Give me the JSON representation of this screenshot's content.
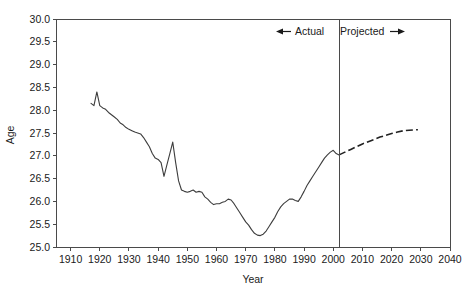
{
  "chart_data": {
    "type": "line",
    "title": "",
    "xlabel": "Year",
    "ylabel": "Age",
    "xlim": [
      1905,
      2040
    ],
    "ylim": [
      25.0,
      30.0
    ],
    "grid": false,
    "legend_position": "none",
    "xticks": [
      1910,
      1920,
      1930,
      1940,
      1950,
      1960,
      1970,
      1980,
      1990,
      2000,
      2010,
      2020,
      2030,
      2040
    ],
    "xticklabels": [
      "1910",
      "1920",
      "1930",
      "1940",
      "1950",
      "1960",
      "1970",
      "1980",
      "1990",
      "2000",
      "2010",
      "2020",
      "2030",
      "2040"
    ],
    "yticks": [
      25.0,
      25.5,
      26.0,
      26.5,
      27.0,
      27.5,
      28.0,
      28.5,
      29.0,
      29.5,
      30.0
    ],
    "yticklabels": [
      "25.0",
      "25.5",
      "26.0",
      "26.5",
      "27.0",
      "27.5",
      "28.0",
      "28.5",
      "29.0",
      "29.5",
      "30.0"
    ],
    "annotations": [
      {
        "label": "Actual",
        "arrow": "left",
        "at_year": 1985
      },
      {
        "label": "Projected",
        "arrow": "right",
        "at_year": 2020
      }
    ],
    "divider_year": 2002,
    "series": [
      {
        "name": "Actual",
        "style": "solid",
        "x": [
          1917,
          1918,
          1919,
          1920,
          1921,
          1922,
          1923,
          1924,
          1925,
          1926,
          1927,
          1928,
          1929,
          1930,
          1931,
          1932,
          1933,
          1934,
          1935,
          1936,
          1937,
          1938,
          1939,
          1940,
          1941,
          1942,
          1943,
          1944,
          1945,
          1946,
          1947,
          1948,
          1949,
          1950,
          1951,
          1952,
          1953,
          1954,
          1955,
          1956,
          1957,
          1958,
          1959,
          1960,
          1961,
          1962,
          1963,
          1964,
          1965,
          1966,
          1967,
          1968,
          1969,
          1970,
          1971,
          1972,
          1973,
          1974,
          1975,
          1976,
          1977,
          1978,
          1979,
          1980,
          1981,
          1982,
          1983,
          1984,
          1985,
          1986,
          1987,
          1988,
          1989,
          1990,
          1991,
          1992,
          1993,
          1994,
          1995,
          1996,
          1997,
          1998,
          1999,
          2000,
          2001,
          2002
        ],
        "values": [
          28.15,
          28.1,
          28.4,
          28.1,
          28.05,
          28.02,
          27.95,
          27.9,
          27.85,
          27.8,
          27.72,
          27.68,
          27.62,
          27.58,
          27.55,
          27.52,
          27.5,
          27.48,
          27.4,
          27.3,
          27.2,
          27.05,
          26.95,
          26.92,
          26.85,
          26.55,
          26.8,
          27.05,
          27.3,
          26.85,
          26.45,
          26.25,
          26.22,
          26.2,
          26.22,
          26.25,
          26.2,
          26.22,
          26.2,
          26.1,
          26.05,
          25.98,
          25.93,
          25.95,
          25.95,
          25.98,
          26.0,
          26.05,
          26.03,
          25.95,
          25.85,
          25.75,
          25.65,
          25.55,
          25.48,
          25.38,
          25.3,
          25.26,
          25.25,
          25.28,
          25.35,
          25.45,
          25.55,
          25.65,
          25.78,
          25.88,
          25.95,
          26.0,
          26.05,
          26.05,
          26.02,
          26.0,
          26.1,
          26.22,
          26.35,
          26.45,
          26.55,
          26.65,
          26.75,
          26.85,
          26.95,
          27.02,
          27.08,
          27.12,
          27.05,
          27.02
        ]
      },
      {
        "name": "Projected",
        "style": "dashed",
        "x": [
          2002,
          2004,
          2006,
          2008,
          2010,
          2012,
          2014,
          2016,
          2018,
          2020,
          2022,
          2024,
          2026,
          2028,
          2029
        ],
        "values": [
          27.02,
          27.08,
          27.14,
          27.2,
          27.26,
          27.31,
          27.36,
          27.41,
          27.45,
          27.49,
          27.52,
          27.55,
          27.56,
          27.57,
          27.57
        ]
      }
    ]
  },
  "axes": {
    "ylabel": "Age",
    "xlabel": "Year"
  },
  "annotations": {
    "actual_label": "Actual",
    "projected_label": "Projected"
  },
  "colors": {
    "axis": "#4a4a4a",
    "actual_line": "#3d3d3d",
    "projected_line": "#222222",
    "text": "#1a1a1a",
    "background": "#ffffff"
  }
}
